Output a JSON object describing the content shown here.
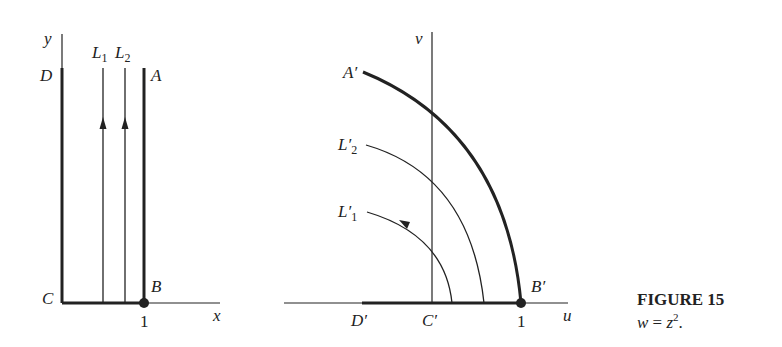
{
  "figure": {
    "title": "FIGURE 15",
    "caption_var": "w",
    "caption_eq": " = ",
    "caption_rhs": "z",
    "caption_exp": "2",
    "caption_end": "."
  },
  "z_plane": {
    "axis_x": "x",
    "axis_y": "y",
    "points": {
      "A": "A",
      "B": "B",
      "C": "C",
      "D": "D"
    },
    "lines": [
      {
        "name": "L",
        "sub": "1"
      },
      {
        "name": "L",
        "sub": "2"
      }
    ],
    "tick_1": "1"
  },
  "w_plane": {
    "axis_u": "u",
    "axis_v": "v",
    "points": {
      "A": "A′",
      "B": "B′",
      "C": "C′",
      "D": "D′"
    },
    "curves": [
      {
        "name": "L′",
        "sub": "2"
      },
      {
        "name": "L′",
        "sub": "1"
      }
    ],
    "tick_1": "1"
  },
  "colors": {
    "ink": "#222222",
    "background": "#ffffff"
  }
}
